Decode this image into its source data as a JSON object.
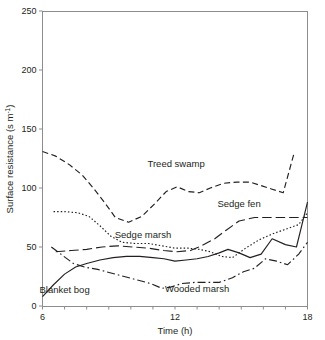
{
  "chart_data": {
    "type": "line",
    "title": "",
    "xlabel": "Time (h)",
    "ylabel": "Surface resistance (s m-1)",
    "ylabel_main": "Surface resistance (s m",
    "ylabel_sup": "-1",
    "ylabel_tail": ")",
    "xlim": [
      6,
      18
    ],
    "ylim": [
      0,
      250
    ],
    "xticks": [
      6,
      7,
      8,
      9,
      10,
      11,
      12,
      13,
      14,
      15,
      16,
      17,
      18
    ],
    "xtick_labels": [
      "6",
      "",
      "",
      "",
      "",
      "",
      "12",
      "",
      "",
      "",
      "",
      "",
      "18"
    ],
    "yticks": [
      0,
      50,
      100,
      150,
      200,
      250
    ],
    "ytick_labels": [
      "0",
      "50",
      "100",
      "150",
      "200",
      "250"
    ],
    "grid": false,
    "legend_position": "inline-annotations",
    "series": [
      {
        "name": "Treed swamp",
        "style": "dashed",
        "label_x": 12.05,
        "label_y": 118,
        "x": [
          6.0,
          6.6,
          7.2,
          7.8,
          8.3,
          8.8,
          9.3,
          9.9,
          10.5,
          11.1,
          11.6,
          12.1,
          12.6,
          13.1,
          13.6,
          14.2,
          14.8,
          15.4,
          15.9,
          16.4,
          16.9,
          17.4
        ],
        "y": [
          131,
          127,
          120,
          111,
          100,
          88,
          75,
          71,
          76,
          87,
          97,
          101,
          97,
          96,
          100,
          104,
          105,
          105,
          102,
          99,
          96,
          130
        ]
      },
      {
        "name": "Sedge marsh",
        "style": "dotted",
        "label_x": 10.55,
        "label_y": 58,
        "x": [
          6.5,
          7.0,
          7.6,
          8.1,
          8.6,
          9.1,
          9.6,
          10.2,
          10.8,
          11.4,
          12.0,
          12.6,
          13.1,
          13.6,
          14.1,
          14.6,
          15.2,
          15.8,
          16.4,
          17.0,
          17.6,
          18.0
        ],
        "y": [
          80,
          80,
          79,
          76,
          68,
          59,
          54,
          53,
          53,
          51,
          49,
          49,
          48,
          46,
          42,
          41,
          49,
          56,
          61,
          65,
          69,
          79
        ]
      },
      {
        "name": "Sedge fen",
        "style": "longdash",
        "label_x": 14.9,
        "label_y": 84,
        "x": [
          6.6,
          7.3,
          8.0,
          8.7,
          9.4,
          10.1,
          10.8,
          11.5,
          12.1,
          12.7,
          13.2,
          13.8,
          14.3,
          14.9,
          15.6,
          16.2,
          16.7,
          17.2,
          17.6,
          18.0
        ],
        "y": [
          46,
          47,
          48,
          50,
          51,
          50,
          49,
          47,
          46,
          47,
          51,
          57,
          64,
          72,
          75,
          75,
          75,
          75,
          75,
          75
        ]
      },
      {
        "name": "Blanket bog",
        "style": "solid",
        "label_x": 7.0,
        "label_y": 11,
        "x": [
          6.0,
          6.5,
          7.0,
          7.5,
          8.0,
          8.6,
          9.2,
          9.8,
          10.4,
          11.0,
          11.5,
          12.0,
          12.5,
          13.0,
          13.5,
          14.0,
          14.4,
          14.9,
          15.4,
          15.9,
          16.4,
          17.0,
          17.5,
          18.0
        ],
        "y": [
          8,
          18,
          27,
          33,
          36,
          39,
          41,
          42,
          42,
          41,
          40,
          38,
          39,
          40,
          42,
          45,
          48,
          45,
          41,
          44,
          57,
          52,
          50,
          88
        ]
      },
      {
        "name": "Wooded marsh",
        "style": "dashdot",
        "label_x": 13.0,
        "label_y": 12,
        "x": [
          6.4,
          6.9,
          7.4,
          7.9,
          8.5,
          9.1,
          9.7,
          10.3,
          10.9,
          11.4,
          11.8,
          12.3,
          12.9,
          13.5,
          14.0,
          14.6,
          15.1,
          15.6,
          16.1,
          16.6,
          17.1,
          17.6,
          18.0
        ],
        "y": [
          50,
          43,
          36,
          33,
          31,
          28,
          25,
          22,
          19,
          15,
          16,
          19,
          20,
          20,
          20,
          24,
          29,
          32,
          40,
          38,
          35,
          44,
          54
        ]
      }
    ]
  }
}
